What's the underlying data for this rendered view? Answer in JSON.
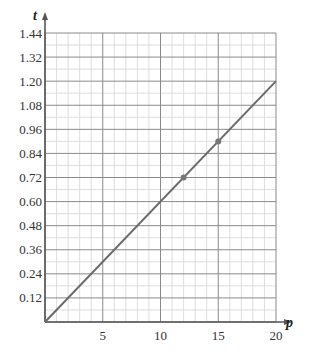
{
  "chart_data": {
    "type": "line",
    "title": "",
    "xlabel": "p",
    "ylabel": "t",
    "xlim": [
      0,
      20
    ],
    "ylim": [
      0,
      1.44
    ],
    "x_ticks": [
      5,
      10,
      15,
      20
    ],
    "x_tick_labels": [
      "5",
      "10",
      "15",
      "20"
    ],
    "y_ticks": [
      0.12,
      0.24,
      0.36,
      0.48,
      0.6,
      0.72,
      0.84,
      0.96,
      1.08,
      1.2,
      1.32,
      1.44
    ],
    "y_tick_labels": [
      "0.12",
      "0.24",
      "0.36",
      "0.48",
      "0.60",
      "0.72",
      "0.84",
      "0.96",
      "1.08",
      "1.20",
      "1.32",
      "1.44"
    ],
    "grid": true,
    "x_minor_step": 1,
    "x_major_step": 5,
    "y_minor_step": 0.06,
    "y_major_step": 0.12,
    "series": [
      {
        "name": "t = 0.06p",
        "x": [
          0,
          20
        ],
        "y": [
          0,
          1.2
        ]
      }
    ],
    "marked_points": [
      {
        "x": 12,
        "y": 0.72
      },
      {
        "x": 15,
        "y": 0.9
      }
    ],
    "colors": {
      "line": "#6b6b6b",
      "grid_minor": "#d6d6d6",
      "grid_major": "#8a8a8a",
      "axis": "#555555",
      "point": "#777777"
    }
  }
}
